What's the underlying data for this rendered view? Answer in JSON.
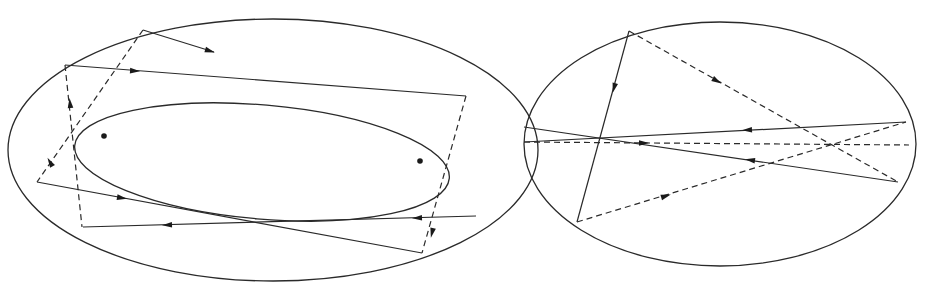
{
  "figure": {
    "width": 925,
    "height": 288,
    "stroke_color": "#2a2a2a",
    "panels": [
      {
        "name": "left-panel",
        "outer_ellipse": {
          "cx": 273,
          "cy": 150,
          "rx": 265,
          "ry": 131,
          "rot": 0
        },
        "inner_ellipse": {
          "cx": 262,
          "cy": 162,
          "rx": 188,
          "ry": 57,
          "rot": 5
        },
        "foci": [
          {
            "x": 104,
            "y": 136
          },
          {
            "x": 420,
            "y": 161
          }
        ],
        "solid_segments": [
          {
            "x1": 65,
            "y1": 65,
            "x2": 466,
            "y2": 96
          },
          {
            "x1": 143,
            "y1": 30,
            "x2": 214,
            "y2": 52
          },
          {
            "x1": 37,
            "y1": 182,
            "x2": 422,
            "y2": 253
          },
          {
            "x1": 83,
            "y1": 227,
            "x2": 476,
            "y2": 216
          }
        ],
        "dashed_segments": [
          {
            "x1": 65,
            "y1": 65,
            "x2": 82,
            "y2": 227
          },
          {
            "x1": 143,
            "y1": 30,
            "x2": 37,
            "y2": 182
          },
          {
            "x1": 466,
            "y1": 96,
            "x2": 422,
            "y2": 253
          }
        ],
        "arrows": [
          {
            "x": 135,
            "y": 71,
            "angle": 4
          },
          {
            "x": 210,
            "y": 51,
            "angle": 17
          },
          {
            "x": 70,
            "y": 103,
            "angle": -96
          },
          {
            "x": 50,
            "y": 162,
            "angle": -120
          },
          {
            "x": 122,
            "y": 198,
            "angle": 10
          },
          {
            "x": 167,
            "y": 225,
            "angle": 178
          },
          {
            "x": 417,
            "y": 218,
            "angle": 178
          },
          {
            "x": 432,
            "y": 233,
            "angle": 103
          }
        ]
      },
      {
        "name": "right-panel",
        "outer_ellipse": {
          "cx": 720,
          "cy": 144,
          "rx": 196,
          "ry": 122,
          "rot": 0
        },
        "foci": [
          {
            "x": 600,
            "y": 138
          },
          {
            "x": 833,
            "y": 144
          }
        ],
        "solid_segments": [
          {
            "x1": 629,
            "y1": 31,
            "x2": 577,
            "y2": 222
          },
          {
            "x1": 524,
            "y1": 127,
            "x2": 898,
            "y2": 182
          },
          {
            "x1": 524,
            "y1": 142,
            "x2": 906,
            "y2": 122
          }
        ],
        "dashed_segments": [
          {
            "x1": 629,
            "y1": 31,
            "x2": 898,
            "y2": 182
          },
          {
            "x1": 577,
            "y1": 222,
            "x2": 906,
            "y2": 122
          },
          {
            "x1": 524,
            "y1": 142,
            "x2": 909,
            "y2": 145
          }
        ],
        "arrows": [
          {
            "x": 614,
            "y": 88,
            "angle": 105
          },
          {
            "x": 717,
            "y": 81,
            "angle": 30
          },
          {
            "x": 747,
            "y": 130,
            "angle": 177
          },
          {
            "x": 750,
            "y": 160,
            "angle": 188
          },
          {
            "x": 666,
            "y": 196,
            "angle": -17
          },
          {
            "x": 644,
            "y": 143,
            "angle": 0
          }
        ]
      }
    ]
  }
}
